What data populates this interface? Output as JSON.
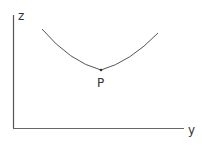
{
  "diagram": {
    "axes": {
      "vertical_label": "z",
      "horizontal_label": "y"
    },
    "curve": {
      "shape": "convex curve with minimum",
      "minimum_point_label": "P"
    },
    "colors": {
      "line": "#555555",
      "background": "#ffffff"
    }
  }
}
